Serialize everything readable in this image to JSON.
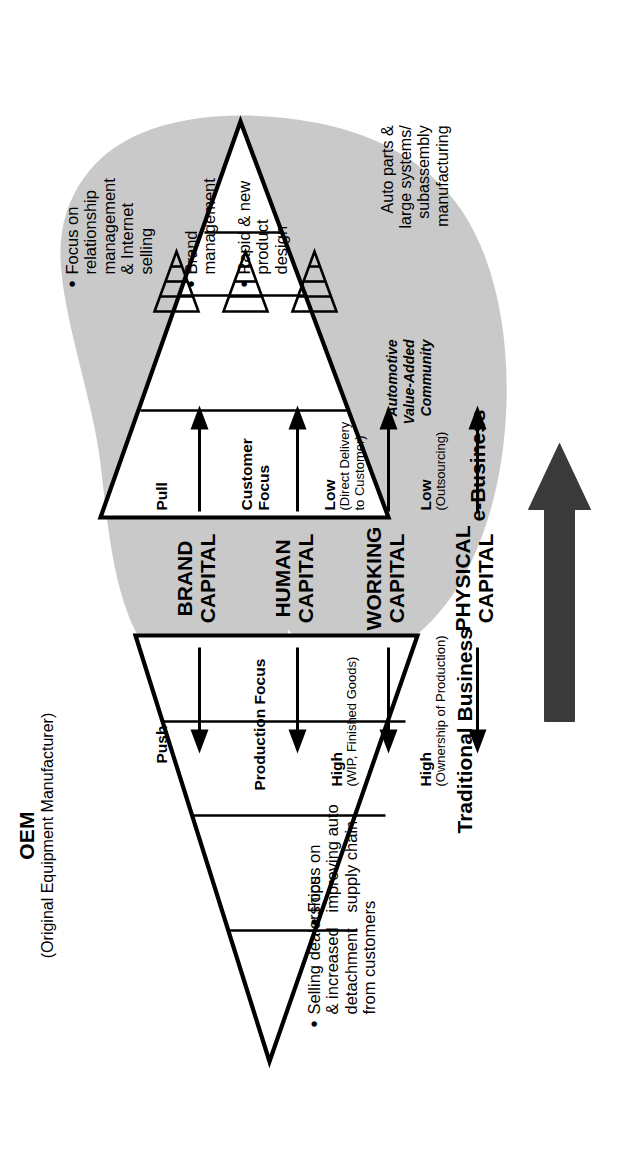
{
  "figure": {
    "type": "business-transition-diagram",
    "left_stage_label": "Traditional Business",
    "right_stage_label": "e-Business",
    "transition_arrow": "big-right-arrow"
  },
  "oem": {
    "acronym": "OEM",
    "expansion": "(Original Equipment Manufacturer)",
    "bullets": [
      "Selling dealerships\n& increased\ndetachment\nfrom customers",
      "Focus on\nimproving auto\nsupply chain"
    ],
    "bullet_1_lines": [
      "Selling dealerships",
      "& increased",
      "detachment",
      "from customers"
    ],
    "bullet_2_lines": [
      "Focus on",
      "improving auto",
      "supply chain"
    ]
  },
  "vbo": {
    "acronym": "VBO",
    "expansion": "(Vehicle Brand Owner)",
    "bullets": [
      "Focus on\nrelationship\nmanagement\n& Internet\nselling",
      "Brand\nmanagement",
      "Rapid & new\nproduct\ndesign"
    ],
    "bullet_1_lines": [
      "Focus on",
      "relationship",
      "management",
      "& Internet",
      "selling"
    ],
    "bullet_2_lines": [
      "Brand",
      "management"
    ],
    "bullet_3_lines": [
      "Rapid & new",
      "product",
      "design"
    ]
  },
  "capital_rows": [
    {
      "name": "BRAND\nCAPITAL",
      "title_line1": "BRAND",
      "title_line2": "CAPITAL",
      "left_value": "Push",
      "left_note": "",
      "right_value": "Pull",
      "right_note": ""
    },
    {
      "name": "HUMAN\nCAPITAL",
      "title_line1": "HUMAN",
      "title_line2": "CAPITAL",
      "left_value": "Production Focus",
      "left_note": "",
      "right_value": "Customer\nFocus",
      "right_note": ""
    },
    {
      "name": "WORKING\nCAPITAL",
      "title_line1": "WORKING",
      "title_line2": "CAPITAL",
      "left_value": "High",
      "left_note": "(WIP, Finished Goods)",
      "right_value": "Low",
      "right_note": "(Direct Delivery\nto Customer)"
    },
    {
      "name": "PHYSICAL\nCAPITAL",
      "title_line1": "PHYSICAL",
      "title_line2": "CAPITAL",
      "left_value": "High",
      "left_note": "(Ownership of Production)",
      "right_value": "Low",
      "right_note": "(Outsourcing)"
    }
  ],
  "row_text": {
    "r1_left": "Push",
    "r1_right": "Pull",
    "r2_left": "Production Focus",
    "r2_right_l1": "Customer",
    "r2_right_l2": "Focus",
    "r3_left": "High",
    "r3_left_note": "(WIP, Finished Goods)",
    "r3_right": "Low",
    "r3_right_note_l1": "(Direct Delivery",
    "r3_right_note_l2": "to Customer)",
    "r4_left": "High",
    "r4_left_note": "(Ownership of Production)",
    "r4_right": "Low",
    "r4_right_note": "(Outsourcing)"
  },
  "community": {
    "title_l1": "Automotive",
    "title_l2": "Value-Added",
    "title_l3": "Community",
    "caption_l1": "Auto parts &",
    "caption_l2": "large systems/",
    "caption_l3": "subassembly",
    "caption_l4": "manufacturing",
    "icon_count": 3,
    "icon_name": "funnel-triangle-icon"
  },
  "colors": {
    "ink": "#000000",
    "blob_fill": "#c9c9c9",
    "arrow_fill": "#3a3a3a",
    "background": "#ffffff"
  }
}
